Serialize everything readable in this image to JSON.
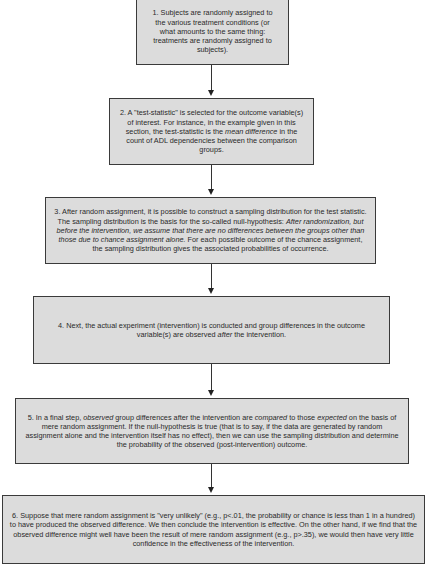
{
  "diagram": {
    "type": "flowchart",
    "direction": "top-to-bottom",
    "colors": {
      "box_fill": "#dcdcdc",
      "box_border": "#3a3a3a",
      "arrow": "#222222"
    },
    "steps": [
      {
        "id": 1,
        "parts": [
          {
            "t": "1. Subjects are randomly assigned to the various treatment conditions (or what amounts to the same thing: treatments are randomly assigned to subjects).",
            "i": false
          }
        ]
      },
      {
        "id": 2,
        "parts": [
          {
            "t": "2. A \"test-statistic\" is selected for the outcome variable(s) of interest. For instance, in the example given in this section, the test-statistic is the ",
            "i": false
          },
          {
            "t": "mean difference",
            "i": true
          },
          {
            "t": " in the count of ADL dependencies between the comparison groups.",
            "i": false
          }
        ]
      },
      {
        "id": 3,
        "parts": [
          {
            "t": "3. After random assignment, it is possible to construct a sampling distribution for the test statistic. The sampling distribution is the basis for the so-called null-hypothesis: ",
            "i": false
          },
          {
            "t": "After randomization, but before the intervention, we assume that there are no differences between the groups other than those due to chance assignment alone.",
            "i": true
          },
          {
            "t": " For each possible outcome of the chance assignment, the sampling distribution gives the associated probabilities of occurrence.",
            "i": false
          }
        ]
      },
      {
        "id": 4,
        "parts": [
          {
            "t": "4. Next, the actual experiment (intervention) is conducted and group differences in the outcome variable(s) are observed ",
            "i": false
          },
          {
            "t": "after",
            "i": true
          },
          {
            "t": " the intervention.",
            "i": false
          }
        ]
      },
      {
        "id": 5,
        "parts": [
          {
            "t": "5. In a final step, ",
            "i": false
          },
          {
            "t": "observed",
            "i": true
          },
          {
            "t": " group differences after the intervention are ",
            "i": false
          },
          {
            "t": "compared",
            "i": true
          },
          {
            "t": " to those ",
            "i": false
          },
          {
            "t": "expected",
            "i": true
          },
          {
            "t": " on the basis of mere random assignment. If the null-hypothesis is true (that is to say, if the data are generated by random assignment alone and the intervention itself has no effect), then we can use the sampling distribution and determine the probability of the observed (post-intervention) outcome.",
            "i": false
          }
        ]
      },
      {
        "id": 6,
        "parts": [
          {
            "t": "6. Suppose that mere random assignment is \"very unlikely\" (e.g., p<.01, the probability or chance is less than 1 in a hundred) to have produced the observed difference. We then conclude the intervention is effective. On the other hand, if we find that the observed difference might well have been the result of mere random assignment (e.g., p>.35), we would then have very little confidence in the effectiveness of the intervention.",
            "i": false
          }
        ]
      }
    ],
    "arrows": [
      {
        "from": 1,
        "to": 2
      },
      {
        "from": 2,
        "to": 3
      },
      {
        "from": 3,
        "to": 4
      },
      {
        "from": 4,
        "to": 5
      },
      {
        "from": 5,
        "to": 6
      }
    ]
  }
}
